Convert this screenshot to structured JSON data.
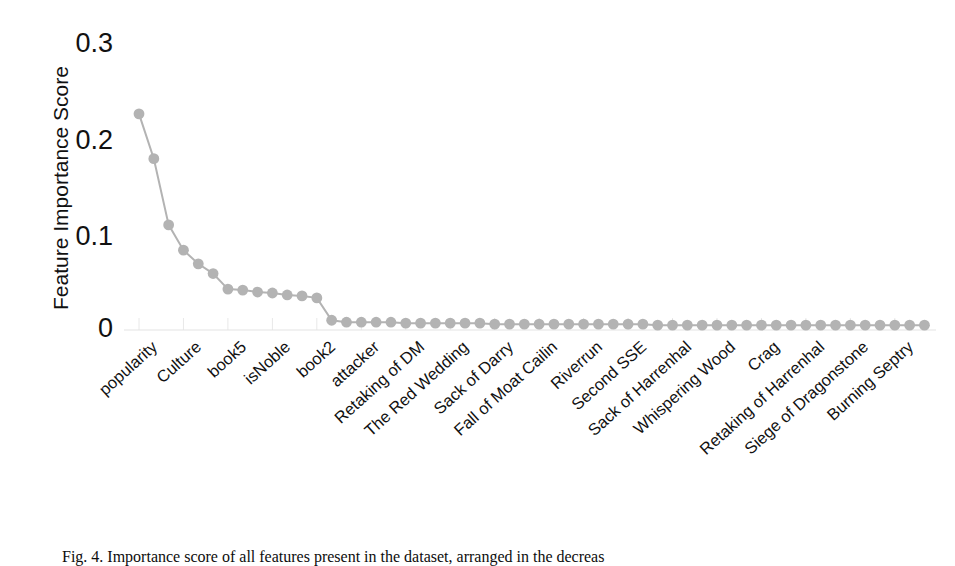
{
  "figure": {
    "caption": "Fig. 4. Importance score of all features present in the dataset, arranged in the decreas"
  },
  "chart_data": {
    "type": "line",
    "title": "",
    "xlabel": "",
    "ylabel": "Feature Importance Score",
    "ylim": [
      0,
      0.3
    ],
    "yticks": [
      0,
      0.1,
      0.2,
      0.3
    ],
    "ytick_labels": [
      "0",
      "0.1",
      "0.2",
      "0.3"
    ],
    "grid": false,
    "legend": null,
    "marker": "circle",
    "series_color": "#b3b3b3",
    "categories": [
      "popularity",
      "male",
      "numDeadRelations",
      "Culture",
      "isAliveMother",
      "book4",
      "book5",
      "isMarried",
      "age",
      "isNoble",
      "book1",
      "book3",
      "book2",
      "isAliveFather",
      "defender",
      "attacker",
      "year",
      "Battle Type",
      "Retaking of DM",
      "Battle of the Blackwater",
      "Battle of Oxcross",
      "The Red Wedding",
      "Battle of the Fords",
      "Sack of Winterfell",
      "Sack of Darry",
      "Battle of the Camps",
      "Battle of the Golden Tooth",
      "Fall of Moat Cailin",
      "Battle of Deepwood Motte",
      "Battle of the Green Fork",
      "Riverrun",
      "Battle of the Ruby Ford",
      "Battle at the Mummer's Ford",
      "Second SSE",
      "Battle of Torrhen's Square",
      "Battle of Castle Black",
      "Sack of Harrenhal",
      "Battle of Duskendale",
      "Battle of the Shield Islands",
      "Whispering Wood",
      "Battle of Winterfell",
      "Siege of Storm's End",
      "Crag",
      "Stony Shore",
      "Battle of the Stepstones",
      "Retaking of Harrenhal",
      "Battle of Darry",
      "Siege of Riverrun",
      "Siege of Dragonstone",
      "Siege of Seagard",
      "Battle of Moat Cailin",
      "Burning Septry",
      "Battle of Raventree",
      "Battle of the Bells"
    ],
    "tick_label_step": 3,
    "values": [
      0.222,
      0.176,
      0.108,
      0.082,
      0.068,
      0.058,
      0.042,
      0.041,
      0.039,
      0.038,
      0.036,
      0.035,
      0.033,
      0.01,
      0.008,
      0.008,
      0.008,
      0.008,
      0.007,
      0.007,
      0.007,
      0.007,
      0.007,
      0.007,
      0.006,
      0.006,
      0.006,
      0.006,
      0.006,
      0.006,
      0.006,
      0.006,
      0.006,
      0.006,
      0.006,
      0.005,
      0.005,
      0.005,
      0.005,
      0.005,
      0.005,
      0.005,
      0.005,
      0.005,
      0.005,
      0.005,
      0.005,
      0.005,
      0.005,
      0.005,
      0.005,
      0.005,
      0.005,
      0.005
    ],
    "visible_tick_labels": [
      "popularity",
      "Culture",
      "book5",
      "isNoble",
      "book2",
      "attacker",
      "Retaking of DM",
      "The Red Wedding",
      "Sack of Darry",
      "Fall of Moat Cailin",
      "Riverrun",
      "Second SSE",
      "Sack of Harrenhal",
      "Whispering Wood",
      "Crag",
      "Retaking of Harrenhal",
      "Siege of Dragonstone",
      "Burning Septry"
    ]
  }
}
